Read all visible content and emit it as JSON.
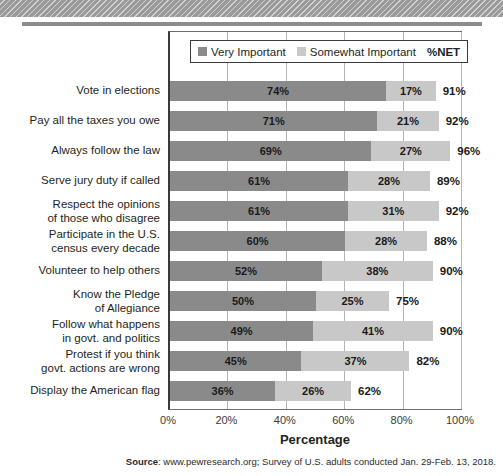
{
  "chart_data": {
    "type": "bar",
    "orientation": "horizontal",
    "stacked": true,
    "title": "",
    "xlabel": "Percentage",
    "ylabel": "",
    "xlim": [
      0,
      100
    ],
    "xticks": [
      "0%",
      "20%",
      "40%",
      "60%",
      "80%",
      "100%"
    ],
    "xtick_values": [
      0,
      20,
      40,
      60,
      80,
      100
    ],
    "grid": true,
    "legend_position": "top-inside",
    "legend": [
      "Very Important",
      "Somewhat Important",
      "%NET"
    ],
    "categories": [
      "Vote in elections",
      "Pay all the taxes you owe",
      "Always follow the law",
      "Serve jury duty if called",
      "Respect the opinions\nof those who disagree",
      "Participate in the U.S.\ncensus every decade",
      "Volunteer to help others",
      "Know the Pledge\nof Allegiance",
      "Follow what happens\nin govt. and politics",
      "Protest if you think\ngovt. actions are wrong",
      "Display the American flag"
    ],
    "series": [
      {
        "name": "Very Important",
        "color": "#8a8a8a",
        "values": [
          74,
          71,
          69,
          61,
          61,
          60,
          52,
          50,
          49,
          45,
          36
        ],
        "labels": [
          "74%",
          "71%",
          "69%",
          "61%",
          "61%",
          "60%",
          "52%",
          "50%",
          "49%",
          "45%",
          "36%"
        ]
      },
      {
        "name": "Somewhat Important",
        "color": "#c8c8c8",
        "values": [
          17,
          21,
          27,
          28,
          31,
          28,
          38,
          25,
          41,
          37,
          26
        ],
        "labels": [
          "17%",
          "21%",
          "27%",
          "28%",
          "31%",
          "28%",
          "38%",
          "25%",
          "41%",
          "37%",
          "26%"
        ]
      }
    ],
    "net": {
      "name": "%NET",
      "values": [
        91,
        92,
        96,
        89,
        92,
        88,
        90,
        75,
        90,
        82,
        62
      ],
      "labels": [
        "91%",
        "92%",
        "96%",
        "89%",
        "92%",
        "88%",
        "90%",
        "75%",
        "90%",
        "82%",
        "62%"
      ]
    }
  },
  "axis": {
    "ticks": [
      "0%",
      "20%",
      "40%",
      "60%",
      "80%",
      "100%"
    ],
    "title": "Percentage"
  },
  "legend": {
    "very_important": "Very Important",
    "somewhat_important": "Somewhat Important",
    "net": "%NET"
  },
  "footer": {
    "source_prefix": "Source",
    "source_text": ": www.pewresearch.org; Survey of U.S. adults conducted Jan. 29-Feb. 13, 2018."
  },
  "colors": {
    "very_important": "#8a8a8a",
    "somewhat_important": "#c8c8c8",
    "axis": "#3a3a3a",
    "grid": "#b5b5b5",
    "band": "#9a9a9a"
  }
}
